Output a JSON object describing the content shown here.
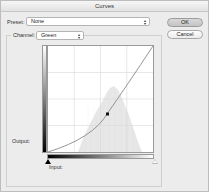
{
  "window": {
    "title": "Curves"
  },
  "preset": {
    "label": "Preset:",
    "value": "None",
    "stepper_icon": "up-down-arrows-icon"
  },
  "channel": {
    "label": "Channel:",
    "value": "Green",
    "stepper_icon": "up-down-arrows-icon"
  },
  "buttons": {
    "ok": "OK",
    "cancel": "Cancel"
  },
  "graph": {
    "output_label": "Output:",
    "input_label": "Input:",
    "grid_divisions": 4,
    "curve_color": "#8a8a8a",
    "histogram_color": "#e4e4e4",
    "control_point": {
      "x_frac": 0.56,
      "y_frac": 0.64
    },
    "black_point_marker": "black-triangle-icon",
    "white_point_marker": "white-triangle-icon"
  }
}
